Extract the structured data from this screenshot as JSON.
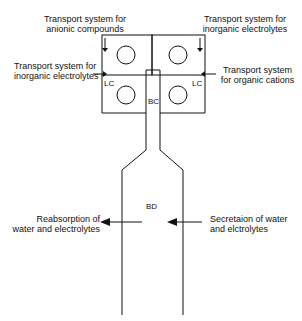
{
  "labels": {
    "anionic": [
      "Transport system for",
      "anionic compounds"
    ],
    "inorganic_top": [
      "Transport system for",
      "inorganic electrolytes"
    ],
    "inorganic_left": [
      "Transport system for",
      "inorganic electrolytes"
    ],
    "organic_cations": [
      "Transport system",
      "for organic cations"
    ],
    "lc_left": "LC",
    "lc_right": "LC",
    "bc": "BC",
    "bd": "BD",
    "reabsorption": [
      "Reabsorption of",
      "water and electrolytes"
    ],
    "secretion": [
      "Secretaion of water",
      "and elctrolytes"
    ]
  },
  "colors": {
    "line": "#111111",
    "background": "#ffffff"
  }
}
